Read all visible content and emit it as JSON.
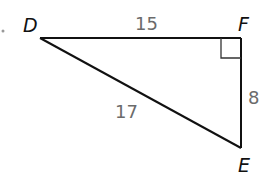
{
  "diagram": {
    "type": "right-triangle",
    "vertices": {
      "D": {
        "label": "D",
        "x": 40,
        "y": 38
      },
      "F": {
        "label": "F",
        "x": 241,
        "y": 38
      },
      "E": {
        "label": "E",
        "x": 241,
        "y": 148
      }
    },
    "sides": {
      "DF": {
        "label": "15"
      },
      "FE": {
        "label": "8"
      },
      "DE": {
        "label": "17"
      }
    },
    "right_angle_at": "F",
    "colors": {
      "line": "#111111",
      "right_angle_marker": "#333333",
      "side_label": "#6b6b6b",
      "vertex_label": "#111111"
    }
  }
}
